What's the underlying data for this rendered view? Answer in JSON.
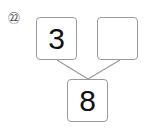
{
  "problem": {
    "number_label": "㉒",
    "number": 22
  },
  "number_bond": {
    "part_left": "3",
    "part_right": "",
    "whole": "8"
  },
  "colors": {
    "box_border": "#9a9a9a",
    "line": "#9a9a9a",
    "text": "#111111"
  }
}
